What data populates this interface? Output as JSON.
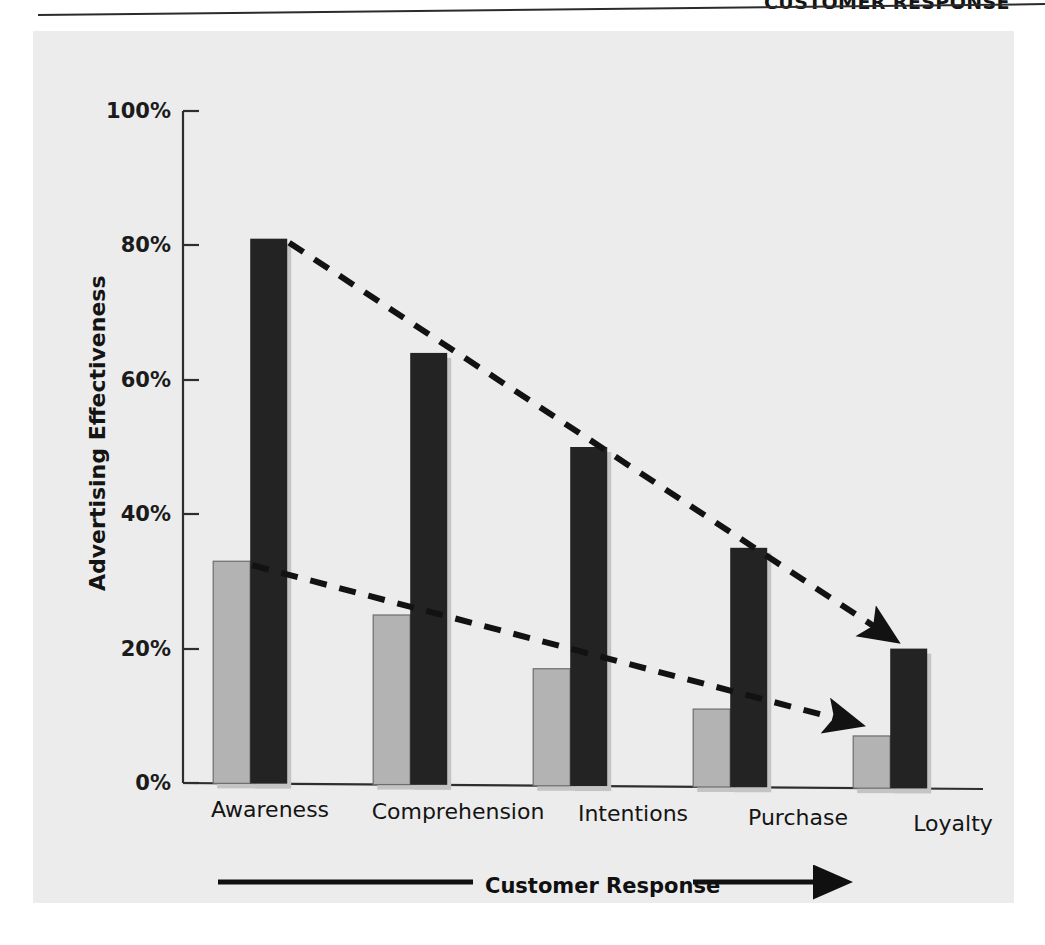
{
  "header": {
    "title": "CUSTOMER RESPONSE"
  },
  "chart_data": {
    "type": "bar",
    "title": "",
    "subtitle": "",
    "xlabel": "Customer Response",
    "ylabel": "Advertising Effectiveness",
    "categories": [
      "Awareness",
      "Comprehension",
      "Intentions",
      "Purchase",
      "Loyalty"
    ],
    "series": [
      {
        "name": "light-gray-series",
        "color": "#b3b3b3",
        "values": [
          33,
          25,
          17,
          11,
          7
        ]
      },
      {
        "name": "dark-series",
        "color": "#232323",
        "values": [
          81,
          64,
          50,
          35,
          20
        ]
      }
    ],
    "ylim": [
      0,
      100
    ],
    "ytick_labels": [
      "0%",
      "20%",
      "40%",
      "60%",
      "80%",
      "100%"
    ],
    "ytick_values": [
      0,
      20,
      40,
      60,
      80,
      100
    ],
    "grid": false,
    "legend": "none",
    "annotations": [
      {
        "name": "dark-trend-arrow",
        "style": "dashed-arrow",
        "from_category": "Awareness",
        "from_value": 81,
        "to_category": "Loyalty",
        "to_value": 20,
        "color": "#121212"
      },
      {
        "name": "gray-trend-arrow",
        "style": "dashed-arrow",
        "from_category": "Awareness",
        "from_value": 33,
        "to_category": "Loyalty",
        "to_value": 7,
        "color": "#121212"
      },
      {
        "name": "customer-response-axis-arrow",
        "style": "solid-arrow-right",
        "label": "Customer Response",
        "color": "#101010"
      }
    ]
  },
  "colors": {
    "panel_background": "#ececec",
    "axis": "#2e2e2e",
    "light_bar": "#b3b3b3",
    "dark_bar": "#232323",
    "text": "#141414"
  }
}
